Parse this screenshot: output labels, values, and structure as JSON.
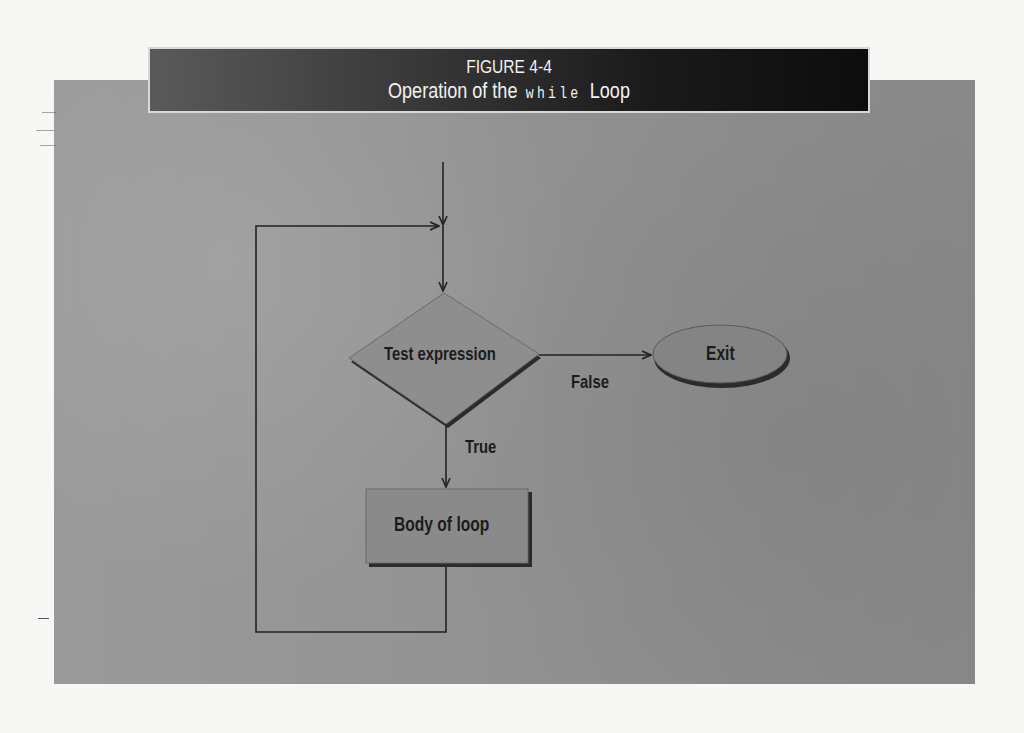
{
  "figure": {
    "number": "FIGURE 4-4",
    "title_prefix": "Operation of the",
    "title_code": "while",
    "title_suffix": "Loop"
  },
  "flowchart": {
    "nodes": [
      {
        "id": "test",
        "shape": "diamond",
        "label": "Test expression"
      },
      {
        "id": "exit",
        "shape": "ellipse",
        "label": "Exit"
      },
      {
        "id": "body",
        "shape": "rectangle",
        "label": "Body of loop"
      }
    ],
    "edges": [
      {
        "from": "entry",
        "to": "test",
        "label": ""
      },
      {
        "from": "test",
        "to": "exit",
        "label": "False"
      },
      {
        "from": "test",
        "to": "body",
        "label": "True"
      },
      {
        "from": "body",
        "to": "test",
        "label": ""
      }
    ]
  },
  "colors": {
    "page": "#f7f7f5",
    "panel": "#949494",
    "banner": "#1e1e1e",
    "banner_text": "#f2f2f2",
    "shape_fill": "#8a8a8a",
    "shape_shadow": "#2b2b2b",
    "line": "#222222"
  }
}
